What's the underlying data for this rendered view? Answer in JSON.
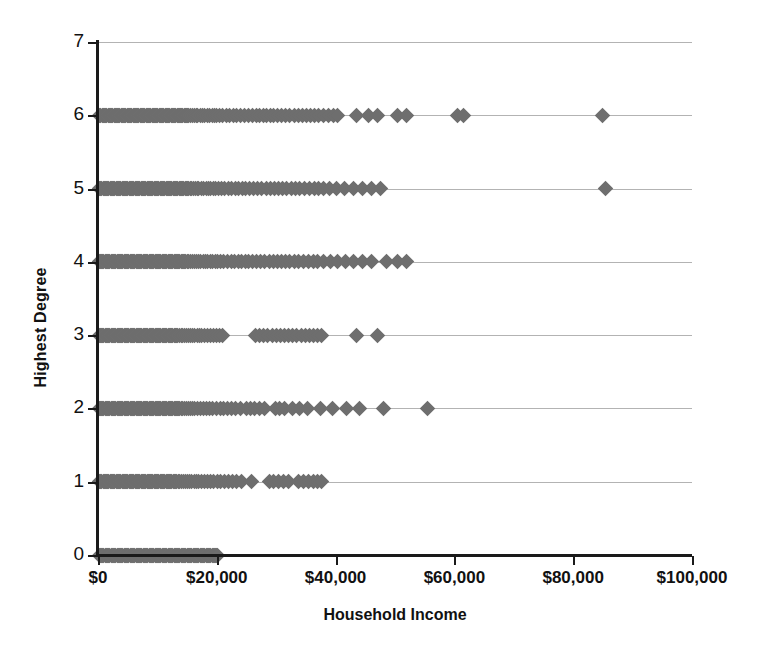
{
  "chart_data": {
    "type": "scatter",
    "title": "",
    "xlabel": "Household Income",
    "ylabel": "Highest Degree",
    "xlim": [
      0,
      100000
    ],
    "ylim": [
      0,
      7
    ],
    "xticks": [
      0,
      20000,
      40000,
      60000,
      80000,
      100000
    ],
    "xticklabels": [
      "$0",
      "$20,000",
      "$40,000",
      "$60,000",
      "$80,000",
      "$100,000"
    ],
    "yticks": [
      0,
      1,
      2,
      3,
      4,
      5,
      6,
      7
    ],
    "yticklabels": [
      "0",
      "1",
      "2",
      "3",
      "4",
      "5",
      "6",
      "7"
    ],
    "grid": "horizontal",
    "legend": null,
    "marker": "diamond",
    "marker_color": "#6e6e6e",
    "marker_size": 11,
    "series": [
      {
        "name": "Respondents",
        "points": [
          {
            "y": 6,
            "x": [
              300,
              500,
              700,
              900,
              1100,
              1300,
              1500,
              1700,
              1900,
              2100,
              2300,
              2500,
              2700,
              2900,
              3100,
              3300,
              3500,
              3700,
              3900,
              4100,
              4300,
              4500,
              4700,
              4900,
              5100,
              5300,
              5500,
              5700,
              5900,
              6100,
              6300,
              6500,
              6700,
              6900,
              7100,
              7300,
              7500,
              7700,
              7900,
              8100,
              8300,
              8500,
              8700,
              8900,
              9100,
              9300,
              9500,
              9700,
              9900,
              10100,
              10300,
              10500,
              10700,
              10900,
              11100,
              11300,
              11500,
              11700,
              11900,
              12100,
              12300,
              12500,
              12700,
              12900,
              13100,
              13300,
              13500,
              13700,
              13900,
              14100,
              14300,
              14500,
              14700,
              14900,
              15100,
              15300,
              15600,
              15900,
              16200,
              16500,
              16800,
              17200,
              17600,
              18000,
              18400,
              18800,
              19200,
              19600,
              20000,
              20500,
              21000,
              21600,
              22200,
              22800,
              23400,
              24000,
              24700,
              25400,
              26000,
              26600,
              27200,
              27800,
              28400,
              29000,
              29600,
              30200,
              30900,
              31600,
              32300,
              33000,
              33700,
              34400,
              35100,
              35800,
              36500,
              37200,
              38000,
              38800,
              39600,
              40400,
              43500,
              45500,
              47000,
              50500,
              52000,
              60500,
              61500,
              85000
            ]
          },
          {
            "y": 5,
            "x": [
              250,
              450,
              650,
              850,
              1050,
              1250,
              1450,
              1650,
              1850,
              2050,
              2250,
              2450,
              2650,
              2850,
              3050,
              3250,
              3450,
              3650,
              3850,
              4050,
              4250,
              4450,
              4650,
              4850,
              5050,
              5250,
              5450,
              5650,
              5850,
              6050,
              6250,
              6450,
              6650,
              6850,
              7050,
              7250,
              7450,
              7650,
              7850,
              8050,
              8250,
              8450,
              8650,
              8850,
              9050,
              9250,
              9450,
              9650,
              9850,
              10050,
              10250,
              10450,
              10650,
              10850,
              11050,
              11250,
              11450,
              11650,
              11850,
              12050,
              12250,
              12450,
              12650,
              12850,
              13050,
              13250,
              13450,
              13650,
              13850,
              14050,
              14250,
              14450,
              14650,
              14850,
              15050,
              15250,
              15500,
              15800,
              16100,
              16400,
              16700,
              17000,
              17400,
              17800,
              18200,
              18600,
              19000,
              19400,
              19800,
              20300,
              20800,
              21300,
              21900,
              22500,
              23100,
              23700,
              24300,
              24900,
              25500,
              26200,
              26900,
              27600,
              28300,
              29000,
              29700,
              30400,
              31100,
              31800,
              32500,
              33200,
              34000,
              34800,
              35600,
              36400,
              37200,
              38000,
              39000,
              40200,
              41500,
              43000,
              44500,
              46000,
              47500,
              85500
            ]
          },
          {
            "y": 4,
            "x": [
              200,
              400,
              600,
              800,
              1000,
              1200,
              1400,
              1600,
              1800,
              2000,
              2200,
              2400,
              2600,
              2800,
              3000,
              3200,
              3400,
              3600,
              3800,
              4000,
              4200,
              4400,
              4600,
              4800,
              5000,
              5200,
              5400,
              5600,
              5800,
              6000,
              6200,
              6400,
              6600,
              6800,
              7000,
              7200,
              7400,
              7600,
              7800,
              8000,
              8200,
              8400,
              8600,
              8800,
              9000,
              9200,
              9400,
              9600,
              9800,
              10000,
              10200,
              10400,
              10600,
              10800,
              11000,
              11200,
              11400,
              11600,
              11800,
              12000,
              12200,
              12400,
              12600,
              12800,
              13000,
              13200,
              13400,
              13600,
              13800,
              14000,
              14200,
              14400,
              14600,
              14800,
              15000,
              15300,
              15600,
              15900,
              16200,
              16500,
              16900,
              17300,
              17700,
              18100,
              18500,
              18900,
              19300,
              19700,
              20200,
              20700,
              21200,
              21800,
              22400,
              23000,
              23600,
              24200,
              24800,
              25400,
              26000,
              26700,
              27400,
              28100,
              28800,
              29500,
              30200,
              30900,
              31600,
              32300,
              33000,
              33800,
              34600,
              35400,
              36200,
              37000,
              38000,
              39200,
              40400,
              41600,
              43000,
              44500,
              46000,
              48500,
              50500,
              52000
            ]
          },
          {
            "y": 3,
            "x": [
              200,
              400,
              600,
              800,
              1000,
              1200,
              1400,
              1600,
              1800,
              2000,
              2200,
              2400,
              2600,
              2800,
              3000,
              3200,
              3400,
              3600,
              3800,
              4000,
              4200,
              4400,
              4600,
              4800,
              5000,
              5200,
              5400,
              5600,
              5800,
              6000,
              6200,
              6400,
              6600,
              6800,
              7000,
              7200,
              7400,
              7600,
              7800,
              8000,
              8200,
              8400,
              8600,
              8800,
              9000,
              9200,
              9400,
              9600,
              9800,
              10000,
              10200,
              10400,
              10600,
              10800,
              11000,
              11200,
              11400,
              11600,
              11800,
              12000,
              12200,
              12400,
              12600,
              12800,
              13000,
              13200,
              13400,
              13700,
              14000,
              14300,
              14600,
              14900,
              15200,
              15500,
              15900,
              16300,
              16700,
              17100,
              17500,
              17900,
              18400,
              18900,
              19400,
              19900,
              20400,
              21000,
              26500,
              27200,
              27900,
              28600,
              29300,
              30000,
              30700,
              31400,
              32100,
              32800,
              33500,
              34200,
              34900,
              35600,
              36300,
              37000,
              37600,
              43500,
              47000
            ]
          },
          {
            "y": 2,
            "x": [
              200,
              400,
              600,
              800,
              1000,
              1200,
              1400,
              1600,
              1800,
              2000,
              2200,
              2400,
              2600,
              2800,
              3000,
              3200,
              3400,
              3600,
              3800,
              4000,
              4200,
              4400,
              4600,
              4800,
              5000,
              5200,
              5400,
              5600,
              5800,
              6000,
              6200,
              6400,
              6600,
              6800,
              7000,
              7200,
              7400,
              7600,
              7800,
              8000,
              8200,
              8400,
              8600,
              8800,
              9000,
              9200,
              9400,
              9600,
              9800,
              10000,
              10200,
              10400,
              10600,
              10800,
              11000,
              11200,
              11400,
              11600,
              11800,
              12000,
              12200,
              12400,
              12600,
              12800,
              13000,
              13200,
              13400,
              13600,
              13800,
              14000,
              14300,
              14600,
              14900,
              15200,
              15500,
              15900,
              16300,
              16700,
              17200,
              17700,
              18200,
              18700,
              19200,
              20000,
              20600,
              21200,
              21800,
              22500,
              23200,
              24000,
              25000,
              25700,
              26400,
              27200,
              28000,
              29800,
              30600,
              31400,
              32800,
              34000,
              35200,
              37500,
              39500,
              41800,
              44000,
              48000,
              55500
            ]
          },
          {
            "y": 1,
            "x": [
              250,
              450,
              650,
              850,
              1050,
              1250,
              1450,
              1650,
              1850,
              2050,
              2250,
              2450,
              2650,
              2850,
              3050,
              3250,
              3450,
              3650,
              3850,
              4050,
              4250,
              4450,
              4650,
              4850,
              5050,
              5250,
              5450,
              5650,
              5850,
              6050,
              6250,
              6450,
              6650,
              6850,
              7050,
              7250,
              7450,
              7650,
              7850,
              8050,
              8250,
              8450,
              8650,
              8850,
              9050,
              9250,
              9450,
              9650,
              9850,
              10050,
              10250,
              10450,
              10650,
              10850,
              11050,
              11250,
              11450,
              11650,
              11850,
              12050,
              12250,
              12450,
              12650,
              12850,
              13050,
              13250,
              13500,
              13800,
              14100,
              14400,
              14700,
              15000,
              15400,
              15800,
              16200,
              16600,
              17000,
              17500,
              18000,
              18500,
              19000,
              19500,
              20100,
              20700,
              21300,
              22000,
              22700,
              23400,
              24200,
              25800,
              28800,
              29600,
              30400,
              31200,
              32000,
              33800,
              34600,
              35400,
              36200,
              37000,
              37600
            ]
          },
          {
            "y": 0,
            "x": [
              200,
              400,
              600,
              800,
              1000,
              1200,
              1400,
              1600,
              1800,
              2000,
              2200,
              2400,
              2600,
              2800,
              3000,
              3200,
              3400,
              3600,
              3800,
              4000,
              4200,
              4400,
              4600,
              4800,
              5000,
              5200,
              5400,
              5600,
              5800,
              6000,
              6200,
              6400,
              6600,
              6800,
              7000,
              7200,
              7400,
              7600,
              7800,
              8000,
              8200,
              8400,
              8600,
              8800,
              9000,
              9200,
              9400,
              9600,
              9800,
              10000,
              10200,
              10400,
              10600,
              10800,
              11000,
              11200,
              11400,
              11600,
              11800,
              12000,
              12200,
              12400,
              12600,
              12800,
              13000,
              13200,
              13400,
              13600,
              13800,
              14000,
              14200,
              14400,
              14600,
              14800,
              15000,
              15200,
              15400,
              15600,
              15800,
              16000,
              16200,
              16400,
              16600,
              16800,
              17000,
              17200,
              17400,
              17600,
              17800,
              18000,
              18200,
              18400,
              18600,
              18800,
              19000,
              19200,
              19400,
              19600,
              19800,
              20000,
              20200
            ]
          }
        ]
      }
    ]
  }
}
